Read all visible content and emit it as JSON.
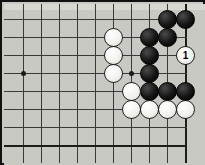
{
  "diagram": {
    "board": {
      "background_color": "#c9c9c4",
      "line_color": "#3a3a3a",
      "border_color": "#111111",
      "grid_spacing_px": 18,
      "origin_x_px": 21,
      "origin_y_px": 17,
      "columns": 10,
      "rows": 8,
      "right_edge_x_px": 183,
      "bottom_edge_y_px": 143
    },
    "star_points": [
      {
        "name": "hoshi-left",
        "col": 0,
        "row": 3
      },
      {
        "name": "hoshi-right",
        "col": 6,
        "row": 3
      }
    ],
    "stones": [
      {
        "id": "b1",
        "color": "black",
        "col": 8,
        "row": 0,
        "label": ""
      },
      {
        "id": "b2",
        "color": "black",
        "col": 9,
        "row": 0,
        "label": ""
      },
      {
        "id": "b3",
        "color": "black",
        "col": 7,
        "row": 1,
        "label": ""
      },
      {
        "id": "b4",
        "color": "black",
        "col": 8,
        "row": 1,
        "label": ""
      },
      {
        "id": "b5",
        "color": "black",
        "col": 7,
        "row": 2,
        "label": ""
      },
      {
        "id": "b6",
        "color": "black",
        "col": 7,
        "row": 3,
        "label": ""
      },
      {
        "id": "b7",
        "color": "black",
        "col": 7,
        "row": 4,
        "label": ""
      },
      {
        "id": "b8",
        "color": "black",
        "col": 8,
        "row": 4,
        "label": ""
      },
      {
        "id": "b9",
        "color": "black",
        "col": 9,
        "row": 4,
        "label": ""
      },
      {
        "id": "w1",
        "color": "white",
        "col": 5,
        "row": 1,
        "label": ""
      },
      {
        "id": "w2",
        "color": "white",
        "col": 5,
        "row": 2,
        "label": ""
      },
      {
        "id": "w3",
        "color": "white",
        "col": 5,
        "row": 3,
        "label": ""
      },
      {
        "id": "w4",
        "color": "white",
        "col": 6,
        "row": 4,
        "label": ""
      },
      {
        "id": "w5",
        "color": "white",
        "col": 6,
        "row": 5,
        "label": ""
      },
      {
        "id": "w6",
        "color": "white",
        "col": 7,
        "row": 5,
        "label": ""
      },
      {
        "id": "w7",
        "color": "white",
        "col": 8,
        "row": 5,
        "label": ""
      },
      {
        "id": "w8",
        "color": "white",
        "col": 9,
        "row": 5,
        "label": ""
      },
      {
        "id": "w-move-1",
        "color": "white",
        "col": 9,
        "row": 2,
        "label": "1"
      }
    ]
  }
}
